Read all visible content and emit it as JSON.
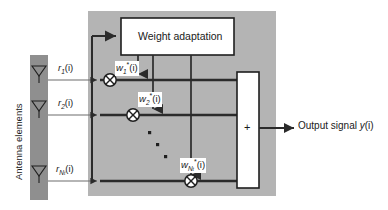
{
  "figure": {
    "title_present": false,
    "background_color": "#ffffff",
    "panel_color": "#b4b4b4",
    "antenna_bar_color": "#8f8f8f",
    "line_color": "#2b2b2b",
    "box_fill": "#ffffff"
  },
  "labels": {
    "antenna_elements": "Antenna elements",
    "weight_adaptation": "Weight adaptation",
    "output_signal_prefix": "Output signal ",
    "output_signal_symbol": "y",
    "output_signal_arg": "(i)",
    "sum_symbol": "+"
  },
  "inputs": [
    {
      "name": "r1",
      "base": "r",
      "sub": "1",
      "arg": "(i)"
    },
    {
      "name": "r2",
      "base": "r",
      "sub": "2",
      "arg": "(i)"
    },
    {
      "name": "rN",
      "base": "r",
      "sub": "N",
      "sub2": "t",
      "arg": "(i)"
    }
  ],
  "weights": [
    {
      "name": "w1",
      "base": "w",
      "sub": "1",
      "star": "*",
      "arg": "(i)"
    },
    {
      "name": "w2",
      "base": "w",
      "sub": "2",
      "star": "*",
      "arg": "(i)"
    },
    {
      "name": "wN",
      "base": "w",
      "sub": "N",
      "sub2": "t",
      "star": "*",
      "arg": "(i)"
    }
  ],
  "ellipsis": {
    "dots": 3,
    "orientation": "diagonal"
  },
  "blocks": {
    "weight_adaptation_box": {
      "label_key": "weight_adaptation"
    },
    "summer_box": {
      "label_key": "sum_symbol"
    }
  },
  "icons": {
    "antenna": "antenna-icon",
    "multiplier": "multiplier-icon"
  }
}
